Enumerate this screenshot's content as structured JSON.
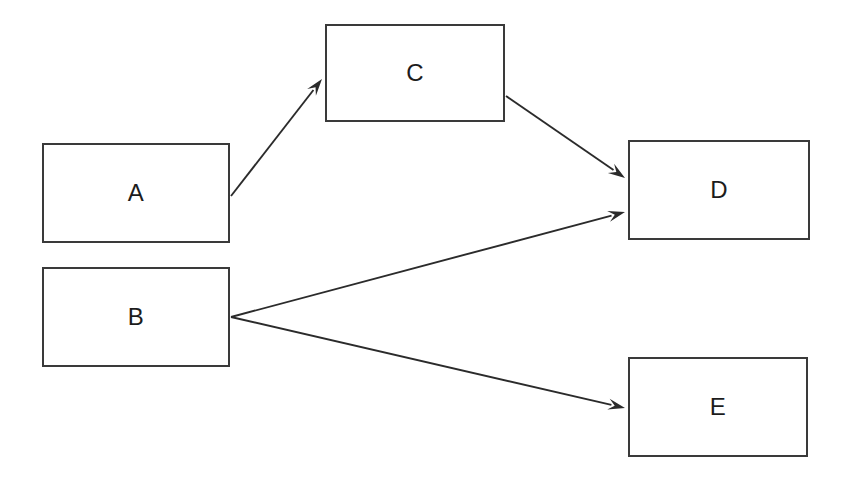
{
  "diagram": {
    "type": "directed-graph",
    "canvas": {
      "width": 849,
      "height": 482,
      "background": "#ffffff"
    },
    "style": {
      "node_fill": "#ffffff",
      "node_border": "#3a3a3a",
      "node_border_width": 2,
      "edge_color": "#2b2b2b",
      "edge_width": 1.9,
      "label_color": "#1c1c1c",
      "label_size": 24
    },
    "nodes": [
      {
        "id": "A",
        "label": "A",
        "x": 42,
        "y": 143,
        "w": 188,
        "h": 100
      },
      {
        "id": "B",
        "label": "B",
        "x": 42,
        "y": 267,
        "w": 188,
        "h": 100
      },
      {
        "id": "C",
        "label": "C",
        "x": 325,
        "y": 24,
        "w": 180,
        "h": 98
      },
      {
        "id": "D",
        "label": "D",
        "x": 628,
        "y": 140,
        "w": 182,
        "h": 100
      },
      {
        "id": "E",
        "label": "E",
        "x": 628,
        "y": 357,
        "w": 180,
        "h": 100
      }
    ],
    "edges": [
      {
        "id": "a-c",
        "from": "A",
        "to": "C",
        "x1": 231,
        "y1": 196,
        "x2": 322,
        "y2": 79,
        "arrowhead": "solid"
      },
      {
        "id": "c-d",
        "from": "C",
        "to": "D",
        "x1": 506,
        "y1": 96,
        "x2": 625,
        "y2": 178,
        "arrowhead": "solid"
      },
      {
        "id": "b-d",
        "from": "B",
        "to": "D",
        "x1": 231,
        "y1": 317,
        "x2": 625,
        "y2": 212,
        "arrowhead": "solid"
      },
      {
        "id": "b-e",
        "from": "B",
        "to": "E",
        "x1": 231,
        "y1": 317,
        "x2": 625,
        "y2": 408,
        "arrowhead": "solid"
      }
    ]
  }
}
